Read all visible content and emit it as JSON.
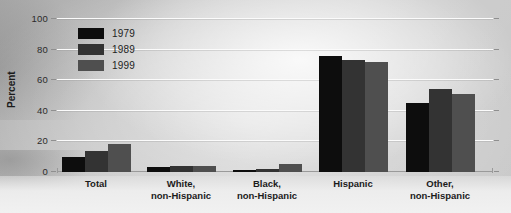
{
  "chart_data": {
    "type": "bar",
    "title": "",
    "subtitle": "",
    "xlabel": "",
    "ylabel": "Percent",
    "ylim": [
      0,
      100
    ],
    "yticks": [
      0,
      20,
      40,
      60,
      80,
      100
    ],
    "ytick_labels": [
      "0",
      "20",
      "40",
      "60",
      "80",
      "100"
    ],
    "grid": true,
    "legend_position": "upper-left-inside",
    "categories": [
      "Total",
      "White,\nnon-Hispanic",
      "Black,\nnon-Hispanic",
      "Hispanic",
      "Other,\nnon-Hispanic"
    ],
    "category_lines": [
      [
        "Total"
      ],
      [
        "White,",
        "non-Hispanic"
      ],
      [
        "Black,",
        "non-Hispanic"
      ],
      [
        "Hispanic"
      ],
      [
        "Other,",
        "non-Hispanic"
      ]
    ],
    "series": [
      {
        "name": "1979",
        "color": "#0d0d0d",
        "values": [
          10,
          3,
          1,
          76,
          45
        ]
      },
      {
        "name": "1989",
        "color": "#333333",
        "values": [
          14,
          4,
          2,
          73,
          54
        ]
      },
      {
        "name": "1999",
        "color": "#4f4f4f",
        "values": [
          18,
          4,
          5,
          72,
          51
        ]
      }
    ]
  },
  "legend": {
    "entries": [
      {
        "label": "1979",
        "color": "#0d0d0d"
      },
      {
        "label": "1989",
        "color": "#333333"
      },
      {
        "label": "1999",
        "color": "#4f4f4f"
      }
    ]
  },
  "axis": {
    "y_title": "Percent"
  }
}
